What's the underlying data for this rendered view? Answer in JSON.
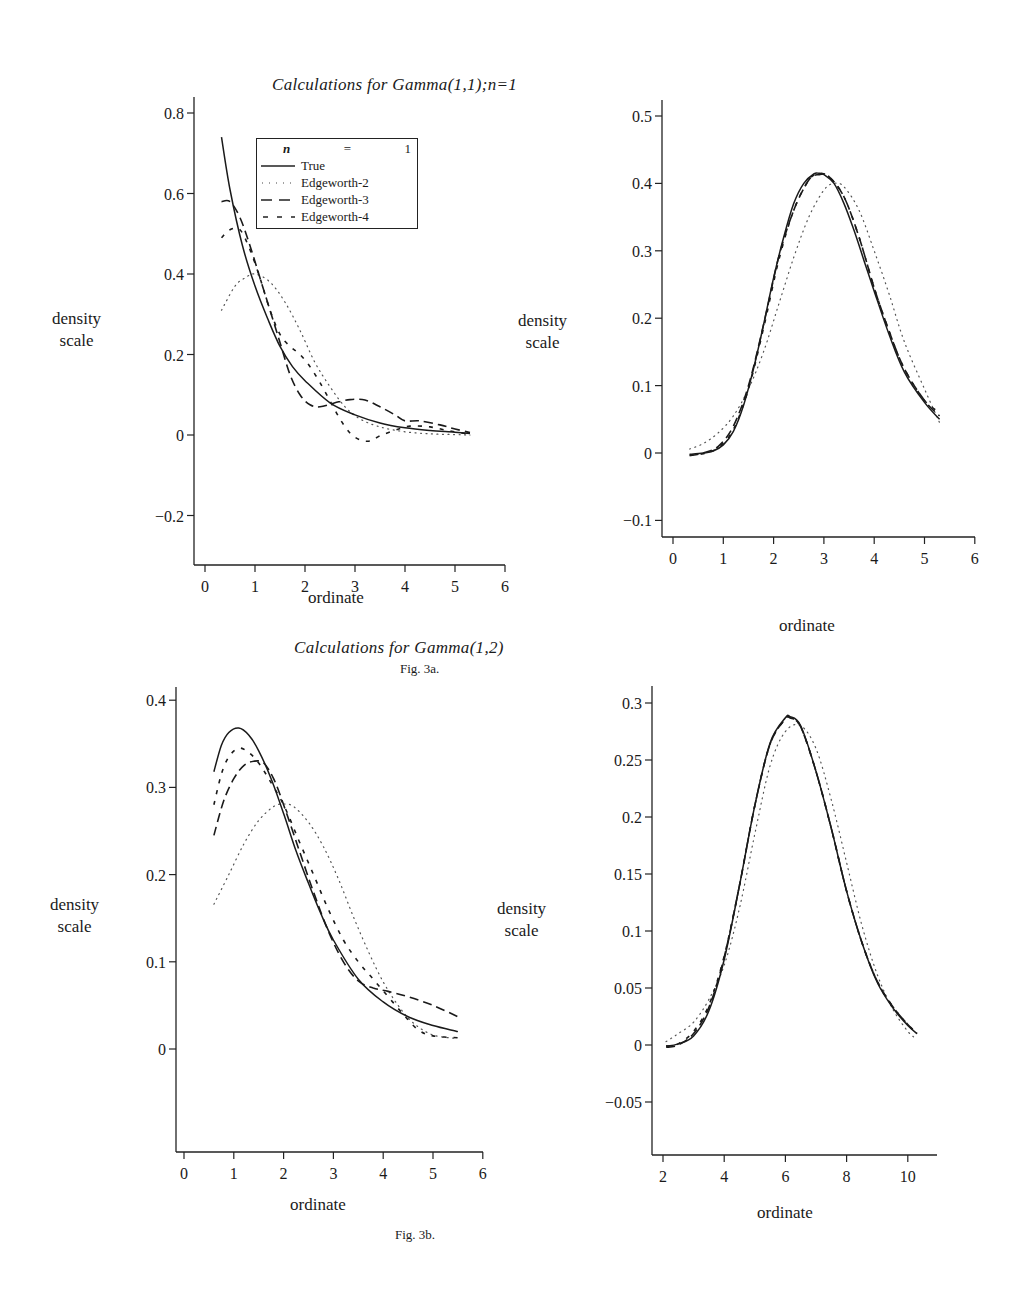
{
  "figure": {
    "title_top": "Calculations for Gamma(1,1);n=1",
    "title_bottom": "Calculations for Gamma(1,2)",
    "fig_label_a": "Fig. 3a.",
    "fig_label_b": "Fig. 3b."
  },
  "legend": {
    "header_var": "n",
    "header_eq": "=",
    "header_val": "1",
    "entries": [
      {
        "label": "True",
        "style": "solid"
      },
      {
        "label": "Edgeworth-2",
        "style": "dotted"
      },
      {
        "label": "Edgeworth-3",
        "style": "longdash"
      },
      {
        "label": "Edgeworth-4",
        "style": "shortdash"
      }
    ]
  },
  "chart_data": [
    {
      "id": "fig3a-left",
      "type": "line",
      "title": "Calculations for Gamma(1,1);n=1",
      "xlabel": "ordinate",
      "ylabel": "density scale",
      "xlim": [
        0,
        6
      ],
      "ylim": [
        -0.2,
        0.8
      ],
      "xticks": [
        0,
        1,
        2,
        3,
        4,
        5,
        6
      ],
      "yticks": [
        -0.2,
        0,
        0.2,
        0.4,
        0.6,
        0.8
      ],
      "ytick_labels": [
        "−0.2",
        "0",
        "0.2",
        "0.4",
        "0.6",
        "0.8"
      ],
      "grid": false,
      "legend_position": "upper inside",
      "series": [
        {
          "name": "True",
          "style": "solid",
          "x": [
            0.33,
            0.5,
            0.75,
            1.0,
            1.25,
            1.5,
            1.75,
            2.0,
            2.5,
            3.0,
            3.5,
            4.0,
            4.5,
            5.0,
            5.3
          ],
          "y": [
            0.74,
            0.61,
            0.47,
            0.37,
            0.29,
            0.22,
            0.17,
            0.135,
            0.08,
            0.05,
            0.03,
            0.018,
            0.011,
            0.007,
            0.004
          ]
        },
        {
          "name": "Edgeworth-2",
          "style": "dotted",
          "x": [
            0.33,
            0.6,
            0.8,
            1.0,
            1.3,
            1.6,
            1.9,
            2.2,
            2.5,
            2.8,
            3.1,
            3.5,
            4.0,
            4.5,
            5.0,
            5.3
          ],
          "y": [
            0.31,
            0.37,
            0.39,
            0.4,
            0.38,
            0.33,
            0.26,
            0.18,
            0.12,
            0.07,
            0.04,
            0.02,
            0.008,
            0.003,
            0.001,
            0.0
          ]
        },
        {
          "name": "Edgeworth-3",
          "style": "longdash",
          "x": [
            0.33,
            0.5,
            0.7,
            0.9,
            1.1,
            1.3,
            1.5,
            1.7,
            1.9,
            2.1,
            2.3,
            2.6,
            2.9,
            3.2,
            3.5,
            3.8,
            4.0,
            4.3,
            4.7,
            5.0,
            5.3
          ],
          "y": [
            0.58,
            0.58,
            0.54,
            0.47,
            0.39,
            0.31,
            0.23,
            0.15,
            0.1,
            0.075,
            0.07,
            0.08,
            0.088,
            0.087,
            0.07,
            0.05,
            0.035,
            0.035,
            0.025,
            0.015,
            0.006
          ]
        },
        {
          "name": "Edgeworth-4",
          "style": "shortdash",
          "x": [
            0.33,
            0.5,
            0.7,
            0.9,
            1.1,
            1.3,
            1.5,
            1.7,
            1.9,
            2.1,
            2.3,
            2.5,
            2.7,
            2.9,
            3.1,
            3.3,
            3.5,
            3.8,
            4.1,
            4.5,
            4.9,
            5.3
          ],
          "y": [
            0.49,
            0.51,
            0.51,
            0.46,
            0.39,
            0.31,
            0.25,
            0.22,
            0.2,
            0.17,
            0.13,
            0.085,
            0.04,
            0.005,
            -0.012,
            -0.015,
            -0.002,
            0.012,
            0.022,
            0.02,
            0.01,
            0.002
          ]
        }
      ]
    },
    {
      "id": "fig3a-right",
      "type": "line",
      "xlabel": "ordinate",
      "ylabel": "density scale",
      "xlim": [
        0,
        6
      ],
      "ylim": [
        -0.1,
        0.5
      ],
      "xticks": [
        0,
        1,
        2,
        3,
        4,
        5,
        6
      ],
      "yticks": [
        -0.1,
        0,
        0.1,
        0.2,
        0.3,
        0.4,
        0.5
      ],
      "ytick_labels": [
        "−0.1",
        "0",
        "0.1",
        "0.2",
        "0.3",
        "0.4",
        "0.5"
      ],
      "grid": false,
      "series": [
        {
          "name": "True",
          "style": "solid",
          "x": [
            0.33,
            0.6,
            0.8,
            1.0,
            1.2,
            1.4,
            1.6,
            1.8,
            2.0,
            2.2,
            2.4,
            2.6,
            2.8,
            2.9,
            3.0,
            3.2,
            3.4,
            3.6,
            3.8,
            4.0,
            4.3,
            4.6,
            5.0,
            5.3
          ],
          "y": [
            -0.002,
            0.0,
            0.003,
            0.012,
            0.032,
            0.07,
            0.125,
            0.19,
            0.26,
            0.32,
            0.37,
            0.4,
            0.414,
            0.415,
            0.413,
            0.4,
            0.37,
            0.33,
            0.285,
            0.24,
            0.175,
            0.12,
            0.075,
            0.05
          ]
        },
        {
          "name": "Edgeworth-2",
          "style": "dotted",
          "x": [
            0.33,
            0.6,
            0.9,
            1.2,
            1.5,
            1.8,
            2.1,
            2.4,
            2.7,
            3.0,
            3.2,
            3.4,
            3.7,
            4.0,
            4.3,
            4.6,
            5.0,
            5.3
          ],
          "y": [
            0.006,
            0.014,
            0.03,
            0.055,
            0.095,
            0.15,
            0.22,
            0.29,
            0.35,
            0.39,
            0.4,
            0.395,
            0.36,
            0.3,
            0.235,
            0.165,
            0.095,
            0.045
          ]
        },
        {
          "name": "Edgeworth-3",
          "style": "longdash",
          "x": [
            0.33,
            0.6,
            0.9,
            1.2,
            1.5,
            1.8,
            2.1,
            2.4,
            2.7,
            2.9,
            3.1,
            3.4,
            3.7,
            4.0,
            4.3,
            4.6,
            5.0,
            5.3
          ],
          "y": [
            -0.004,
            0.0,
            0.01,
            0.04,
            0.1,
            0.19,
            0.29,
            0.36,
            0.405,
            0.413,
            0.41,
            0.38,
            0.32,
            0.245,
            0.18,
            0.125,
            0.078,
            0.055
          ]
        },
        {
          "name": "Edgeworth-4",
          "style": "shortdash",
          "x": [
            0.33,
            0.6,
            0.9,
            1.2,
            1.5,
            1.8,
            2.1,
            2.4,
            2.7,
            2.9,
            3.1,
            3.4,
            3.7,
            4.0,
            4.3,
            4.6,
            5.0,
            5.3
          ],
          "y": [
            -0.003,
            -0.001,
            0.008,
            0.035,
            0.095,
            0.185,
            0.285,
            0.36,
            0.405,
            0.414,
            0.41,
            0.38,
            0.32,
            0.245,
            0.18,
            0.125,
            0.078,
            0.06
          ]
        }
      ]
    },
    {
      "id": "fig3b-left",
      "type": "line",
      "title": "Calculations for Gamma(1,2)",
      "xlabel": "ordinate",
      "ylabel": "density scale",
      "xlim": [
        0,
        6
      ],
      "ylim": [
        0,
        0.4
      ],
      "xticks": [
        0,
        1,
        2,
        3,
        4,
        5,
        6
      ],
      "yticks": [
        0,
        0.1,
        0.2,
        0.3,
        0.4
      ],
      "ytick_labels": [
        "0",
        "0.1",
        "0.2",
        "0.3",
        "0.4"
      ],
      "grid": false,
      "series": [
        {
          "name": "True",
          "style": "solid",
          "x": [
            0.6,
            0.75,
            0.9,
            1.1,
            1.3,
            1.5,
            1.75,
            2.0,
            2.25,
            2.5,
            2.75,
            3.0,
            3.5,
            4.0,
            4.5,
            5.0,
            5.5
          ],
          "y": [
            0.318,
            0.348,
            0.363,
            0.368,
            0.36,
            0.342,
            0.31,
            0.27,
            0.227,
            0.19,
            0.155,
            0.125,
            0.08,
            0.054,
            0.037,
            0.027,
            0.02
          ]
        },
        {
          "name": "Edgeworth-2",
          "style": "dotted",
          "x": [
            0.6,
            0.9,
            1.2,
            1.5,
            1.8,
            2.0,
            2.2,
            2.5,
            2.8,
            3.1,
            3.4,
            3.7,
            4.0,
            4.3,
            4.6,
            5.0,
            5.5
          ],
          "y": [
            0.166,
            0.2,
            0.235,
            0.262,
            0.278,
            0.281,
            0.278,
            0.26,
            0.232,
            0.195,
            0.152,
            0.112,
            0.077,
            0.05,
            0.03,
            0.016,
            0.012
          ]
        },
        {
          "name": "Edgeworth-3",
          "style": "longdash",
          "x": [
            0.6,
            0.8,
            1.0,
            1.2,
            1.4,
            1.6,
            1.8,
            2.0,
            2.3,
            2.6,
            2.9,
            3.2,
            3.5,
            3.8,
            4.1,
            4.5,
            5.0,
            5.5
          ],
          "y": [
            0.245,
            0.285,
            0.31,
            0.325,
            0.33,
            0.328,
            0.31,
            0.28,
            0.23,
            0.18,
            0.135,
            0.1,
            0.078,
            0.07,
            0.066,
            0.06,
            0.05,
            0.037
          ]
        },
        {
          "name": "Edgeworth-4",
          "style": "shortdash",
          "x": [
            0.6,
            0.75,
            0.9,
            1.1,
            1.3,
            1.5,
            1.7,
            2.0,
            2.3,
            2.6,
            2.9,
            3.2,
            3.5,
            3.8,
            4.1,
            4.4,
            4.7,
            5.0,
            5.5
          ],
          "y": [
            0.28,
            0.315,
            0.335,
            0.345,
            0.34,
            0.328,
            0.31,
            0.28,
            0.24,
            0.2,
            0.16,
            0.125,
            0.1,
            0.08,
            0.06,
            0.04,
            0.022,
            0.015,
            0.013
          ]
        }
      ]
    },
    {
      "id": "fig3b-right",
      "type": "line",
      "xlabel": "ordinate",
      "ylabel": "density scale",
      "xlim": [
        1.7,
        11.1
      ],
      "ylim": [
        -0.05,
        0.3
      ],
      "xticks": [
        2,
        4,
        6,
        8,
        10
      ],
      "yticks": [
        -0.05,
        0,
        0.05,
        0.1,
        0.15,
        0.2,
        0.25,
        0.3
      ],
      "ytick_labels": [
        "−0.05",
        "0",
        "0.05",
        "0.1",
        "0.15",
        "0.2",
        "0.25",
        "0.3"
      ],
      "grid": false,
      "series": [
        {
          "name": "True",
          "style": "solid",
          "x": [
            2.1,
            2.5,
            3.0,
            3.5,
            4.0,
            4.5,
            5.0,
            5.5,
            6.0,
            6.15,
            6.5,
            7.0,
            7.5,
            8.0,
            8.5,
            9.0,
            9.5,
            10.0,
            10.3
          ],
          "y": [
            -0.001,
            0.001,
            0.008,
            0.03,
            0.075,
            0.14,
            0.21,
            0.265,
            0.287,
            0.288,
            0.28,
            0.24,
            0.19,
            0.135,
            0.09,
            0.055,
            0.033,
            0.017,
            0.01
          ]
        },
        {
          "name": "Edgeworth-2",
          "style": "dotted",
          "x": [
            2.1,
            2.5,
            3.0,
            3.5,
            4.0,
            4.5,
            5.0,
            5.5,
            6.0,
            6.5,
            7.0,
            7.5,
            8.0,
            8.5,
            9.0,
            9.5,
            10.0,
            10.3
          ],
          "y": [
            0.003,
            0.01,
            0.02,
            0.04,
            0.07,
            0.12,
            0.185,
            0.245,
            0.275,
            0.28,
            0.26,
            0.215,
            0.16,
            0.105,
            0.062,
            0.032,
            0.012,
            0.005
          ]
        },
        {
          "name": "Edgeworth-3",
          "style": "longdash",
          "x": [
            2.1,
            2.5,
            3.0,
            3.5,
            4.0,
            4.5,
            5.0,
            5.5,
            6.0,
            6.15,
            6.5,
            7.0,
            7.5,
            8.0,
            8.5,
            9.0,
            9.5,
            10.0,
            10.3
          ],
          "y": [
            -0.002,
            0.0,
            0.01,
            0.033,
            0.077,
            0.14,
            0.21,
            0.264,
            0.286,
            0.287,
            0.279,
            0.24,
            0.19,
            0.135,
            0.09,
            0.056,
            0.034,
            0.018,
            0.01
          ]
        },
        {
          "name": "Edgeworth-4",
          "style": "shortdash",
          "x": [
            2.1,
            2.5,
            3.0,
            3.5,
            4.0,
            4.5,
            5.0,
            5.5,
            6.0,
            6.15,
            6.5,
            7.0,
            7.5,
            8.0,
            8.5,
            9.0,
            9.5,
            10.0,
            10.3
          ],
          "y": [
            -0.001,
            0.001,
            0.012,
            0.035,
            0.078,
            0.14,
            0.21,
            0.264,
            0.286,
            0.287,
            0.279,
            0.24,
            0.19,
            0.135,
            0.09,
            0.056,
            0.034,
            0.018,
            0.01
          ]
        }
      ]
    }
  ],
  "layout_panels": [
    {
      "axis_x": 194,
      "axis_bottom": 565,
      "axis_top": 97,
      "x_end": 505,
      "x0_px": 205,
      "x_per_unit": 50.0,
      "xmin_val": 0,
      "y0_px": 435,
      "y_per_unit": 402.5,
      "ylab_left": 52,
      "ylab_top": 308,
      "xlab_left": 308,
      "xlab_top": 588
    },
    {
      "axis_x": 662,
      "axis_bottom": 537,
      "axis_top": 100,
      "x_end": 975,
      "x0_px": 673,
      "x_per_unit": 50.3,
      "xmin_val": 0,
      "y0_px": 453,
      "y_per_unit": 674,
      "ylab_left": 518,
      "ylab_top": 310,
      "xlab_left": 779,
      "xlab_top": 616
    },
    {
      "axis_x": 176,
      "axis_bottom": 1152,
      "axis_top": 687,
      "x_end": 483,
      "x0_px": 184,
      "x_per_unit": 49.8,
      "xmin_val": 0,
      "y0_px": 1049,
      "y_per_unit": 872,
      "ylab_left": 50,
      "ylab_top": 894,
      "xlab_left": 290,
      "xlab_top": 1195
    },
    {
      "axis_x": 652,
      "axis_bottom": 1155,
      "axis_top": 686,
      "x_end": 937,
      "x0_px": 663,
      "x_per_unit": 30.6,
      "xmin_val": 2,
      "y0_px": 1045,
      "y_per_unit": 1140,
      "ylab_left": 497,
      "ylab_top": 898,
      "xlab_left": 757,
      "xlab_top": 1203
    }
  ]
}
